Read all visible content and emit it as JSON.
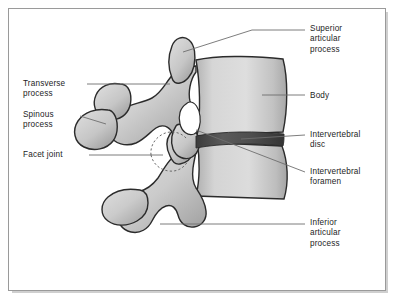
{
  "figure": {
    "view": "lateral (side) view",
    "frame": {
      "border_color": "#9a9a9a",
      "shadow_color": "#cfcfcf",
      "background_color": "#ffffff"
    },
    "colors": {
      "bone_light": "#dcdcdc",
      "bone_mid": "#c3c3c3",
      "bone_shadow": "#a6a6a6",
      "outline": "#2b2b2b",
      "disc_dark": "#4a4a4a",
      "disc_darker": "#3a3a3a",
      "foramen_white": "#ffffff",
      "leader_line": "#6e6e6e",
      "facet_dashed": "#6a6a6a",
      "text": "#1d1d1d"
    }
  },
  "labels": {
    "superior_articular_process": {
      "text": "Superior\narticular\nprocess",
      "side": "right",
      "x": 310,
      "y": 24
    },
    "body": {
      "text": "Body",
      "side": "right",
      "x": 310,
      "y": 91
    },
    "intervertebral_disc": {
      "text": "Intervertebral\ndisc",
      "side": "right",
      "x": 310,
      "y": 130
    },
    "intervertebral_foramen": {
      "text": "Intervertebral\nforamen",
      "side": "right",
      "x": 310,
      "y": 167
    },
    "inferior_articular_process": {
      "text": "Inferior\narticular\nprocess",
      "side": "right",
      "x": 310,
      "y": 218
    },
    "transverse_process": {
      "text": "Transverse\nprocess",
      "side": "left",
      "x": 23,
      "y": 79
    },
    "spinous_process": {
      "text": "Spinous\nprocess",
      "side": "left",
      "x": 23,
      "y": 110
    },
    "facet_joint": {
      "text": "Facet joint",
      "side": "left",
      "x": 23,
      "y": 150
    }
  },
  "structures": [
    {
      "name": "superior-vertebra-body",
      "description": "upper vertebral body, anterior block"
    },
    {
      "name": "inferior-vertebra-body",
      "description": "lower vertebral body, anterior block"
    },
    {
      "name": "intervertebral-disc",
      "description": "dark lens-shaped band between the two bodies"
    },
    {
      "name": "intervertebral-foramen",
      "description": "white aperture between pedicles"
    },
    {
      "name": "superior-articular-process",
      "description": "upward projecting facet of lower vertebra"
    },
    {
      "name": "inferior-articular-process",
      "description": "downward projecting facet of upper vertebra"
    },
    {
      "name": "transverse-process",
      "description": "lateral wing projection"
    },
    {
      "name": "spinous-process",
      "description": "posterior pointed projection"
    },
    {
      "name": "facet-joint",
      "description": "dashed outline where articular processes meet"
    }
  ]
}
